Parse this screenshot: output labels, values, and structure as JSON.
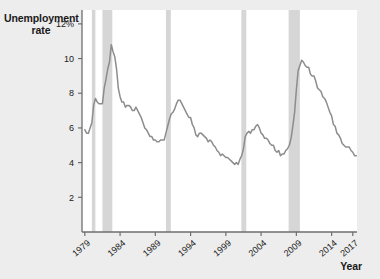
{
  "chart_data": {
    "type": "line",
    "title": "",
    "xlabel": "Year",
    "ylabel": "Unemployment rate",
    "ylim": [
      0,
      12.8
    ],
    "xlim": [
      1978.6,
      2017.6
    ],
    "grid": false,
    "legend": "none",
    "y_tick_labels": [
      "2",
      "4",
      "6",
      "8",
      "10",
      "12%"
    ],
    "y_ticks": [
      2,
      4,
      6,
      8,
      10,
      12
    ],
    "x_tick_labels": [
      "1979",
      "1984",
      "1989",
      "1994",
      "1999",
      "2004",
      "2009",
      "2014",
      "2017"
    ],
    "x_ticks": [
      1979,
      1984,
      1989,
      1994,
      1999,
      2004,
      2009,
      2014,
      2017
    ],
    "line_color": "#8c8c8c",
    "recession_band_color": "#d6d6d6",
    "plot_background": "#ffffff",
    "page_background": "#ededed",
    "series": [
      {
        "name": "Unemployment rate",
        "x": [
          1979.0,
          1979.25,
          1979.5,
          1979.75,
          1980.0,
          1980.25,
          1980.5,
          1980.75,
          1981.0,
          1981.25,
          1981.5,
          1981.75,
          1982.0,
          1982.25,
          1982.5,
          1982.75,
          1983.0,
          1983.25,
          1983.5,
          1983.75,
          1984.0,
          1984.25,
          1984.5,
          1984.75,
          1985.0,
          1985.25,
          1985.5,
          1985.75,
          1986.0,
          1986.25,
          1986.5,
          1986.75,
          1987.0,
          1987.25,
          1987.5,
          1987.75,
          1988.0,
          1988.25,
          1988.5,
          1988.75,
          1989.0,
          1989.25,
          1989.5,
          1989.75,
          1990.0,
          1990.25,
          1990.5,
          1990.75,
          1991.0,
          1991.25,
          1991.5,
          1991.75,
          1992.0,
          1992.25,
          1992.5,
          1992.75,
          1993.0,
          1993.25,
          1993.5,
          1993.75,
          1994.0,
          1994.25,
          1994.5,
          1994.75,
          1995.0,
          1995.25,
          1995.5,
          1995.75,
          1996.0,
          1996.25,
          1996.5,
          1996.75,
          1997.0,
          1997.25,
          1997.5,
          1997.75,
          1998.0,
          1998.25,
          1998.5,
          1998.75,
          1999.0,
          1999.25,
          1999.5,
          1999.75,
          2000.0,
          2000.25,
          2000.5,
          2000.75,
          2001.0,
          2001.25,
          2001.5,
          2001.75,
          2002.0,
          2002.25,
          2002.5,
          2002.75,
          2003.0,
          2003.25,
          2003.5,
          2003.75,
          2004.0,
          2004.25,
          2004.5,
          2004.75,
          2005.0,
          2005.25,
          2005.5,
          2005.75,
          2006.0,
          2006.25,
          2006.5,
          2006.75,
          2007.0,
          2007.25,
          2007.5,
          2007.75,
          2008.0,
          2008.25,
          2008.5,
          2008.75,
          2009.0,
          2009.25,
          2009.5,
          2009.75,
          2010.0,
          2010.25,
          2010.5,
          2010.75,
          2011.0,
          2011.25,
          2011.5,
          2011.75,
          2012.0,
          2012.25,
          2012.5,
          2012.75,
          2013.0,
          2013.25,
          2013.5,
          2013.75,
          2014.0,
          2014.25,
          2014.5,
          2014.75,
          2015.0,
          2015.25,
          2015.5,
          2015.75,
          2016.0,
          2016.25,
          2016.5,
          2016.75,
          2017.0,
          2017.25,
          2017.5
        ],
        "values": [
          5.9,
          5.7,
          5.7,
          6.0,
          6.3,
          7.3,
          7.7,
          7.5,
          7.4,
          7.4,
          7.4,
          8.3,
          8.8,
          9.4,
          9.8,
          10.8,
          10.4,
          10.1,
          9.4,
          8.3,
          7.8,
          7.5,
          7.5,
          7.2,
          7.3,
          7.3,
          7.2,
          7.0,
          7.0,
          7.2,
          7.0,
          6.8,
          6.6,
          6.3,
          6.0,
          5.9,
          5.7,
          5.5,
          5.5,
          5.3,
          5.3,
          5.2,
          5.2,
          5.3,
          5.3,
          5.3,
          5.7,
          6.1,
          6.5,
          6.8,
          6.9,
          7.1,
          7.4,
          7.6,
          7.6,
          7.4,
          7.2,
          7.0,
          6.8,
          6.6,
          6.6,
          6.2,
          6.0,
          5.6,
          5.5,
          5.7,
          5.7,
          5.6,
          5.5,
          5.4,
          5.2,
          5.3,
          5.2,
          5.0,
          4.9,
          4.7,
          4.6,
          4.4,
          4.5,
          4.4,
          4.3,
          4.3,
          4.2,
          4.1,
          4.0,
          3.9,
          4.0,
          3.9,
          4.2,
          4.4,
          4.8,
          5.5,
          5.7,
          5.8,
          5.7,
          5.9,
          5.9,
          6.1,
          6.2,
          6.0,
          5.7,
          5.6,
          5.4,
          5.4,
          5.3,
          5.1,
          5.0,
          5.0,
          4.7,
          4.6,
          4.7,
          4.4,
          4.5,
          4.5,
          4.7,
          4.8,
          5.0,
          5.4,
          6.1,
          6.9,
          8.2,
          9.3,
          9.6,
          9.9,
          9.8,
          9.6,
          9.5,
          9.5,
          9.1,
          9.0,
          9.0,
          8.7,
          8.3,
          8.2,
          8.1,
          7.8,
          7.7,
          7.5,
          7.2,
          6.9,
          6.7,
          6.2,
          6.1,
          5.7,
          5.6,
          5.4,
          5.1,
          5.0,
          4.9,
          4.9,
          4.9,
          4.7,
          4.6,
          4.4,
          4.4
        ]
      }
    ],
    "recession_bands": [
      {
        "label": "1980 recession",
        "start": 1980.0,
        "end": 1980.5
      },
      {
        "label": "1981-82 recession",
        "start": 1981.5,
        "end": 1982.9
      },
      {
        "label": "1990-91 recession",
        "start": 1990.5,
        "end": 1991.2
      },
      {
        "label": "2001 recession",
        "start": 2001.2,
        "end": 2001.9
      },
      {
        "label": "2007-09 recession",
        "start": 2007.9,
        "end": 2009.5
      }
    ]
  }
}
